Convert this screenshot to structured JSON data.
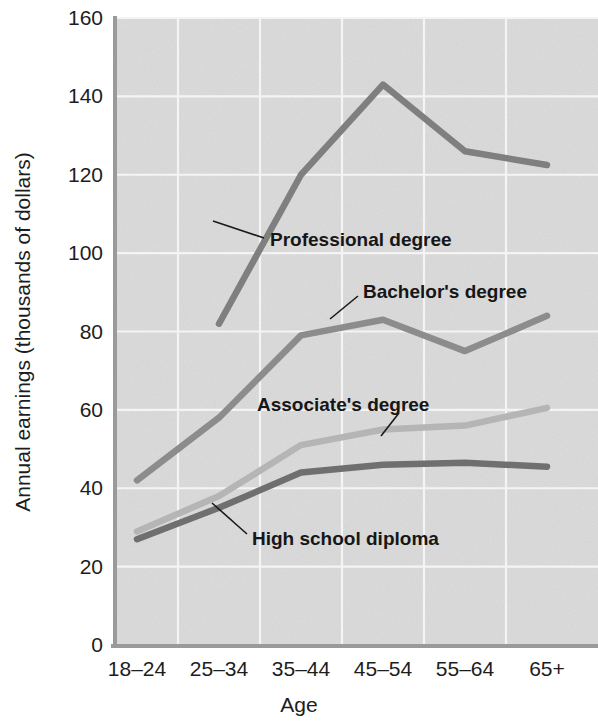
{
  "chart_data": {
    "type": "line",
    "title": "",
    "xlabel": "Age",
    "ylabel": "Annual earnings (thousands of dollars)",
    "categories": [
      "18–24",
      "25–34",
      "35–44",
      "45–54",
      "55–64",
      "65+"
    ],
    "ylim": [
      0,
      160
    ],
    "yticks": [
      0,
      20,
      40,
      60,
      80,
      100,
      120,
      140,
      160
    ],
    "ytick_labels": [
      "0",
      "20",
      "40",
      "60",
      "80",
      "100",
      "120",
      "140",
      "160"
    ],
    "grid": true,
    "legend_position": "inline-annotations",
    "series": [
      {
        "name": "Professional degree",
        "color": "#7f7f7f",
        "values": [
          null,
          82,
          120,
          143,
          126,
          122.5
        ]
      },
      {
        "name": "Bachelor's degree",
        "color": "#8c8c8c",
        "values": [
          42,
          58,
          79,
          83,
          75,
          84
        ]
      },
      {
        "name": "Associate's degree",
        "color": "#b5b5b5",
        "values": [
          29,
          38,
          51,
          55,
          56,
          60.5
        ]
      },
      {
        "name": "High school diploma",
        "color": "#6f6f6f",
        "values": [
          27,
          35,
          44,
          46,
          46.5,
          45.5
        ]
      }
    ],
    "annotations": [
      {
        "text": "Professional degree",
        "x": 270,
        "y": 240
      },
      {
        "text": "Bachelor's degree",
        "x": 345,
        "y": 303
      },
      {
        "text": "Associate's degree",
        "x": 300,
        "y": 406
      },
      {
        "text": "High school diploma",
        "x": 250,
        "y": 538
      }
    ]
  },
  "axes": {
    "x_title": "Age",
    "y_title": "Annual earnings (thousands of dollars)",
    "x_labels": [
      "18–24",
      "25–34",
      "35–44",
      "45–54",
      "55–64",
      "65+"
    ],
    "y_labels": [
      "0",
      "20",
      "40",
      "60",
      "80",
      "100",
      "120",
      "140",
      "160"
    ]
  },
  "labels": {
    "professional": "Professional degree",
    "bachelors": "Bachelor's degree",
    "associates": "Associate's degree",
    "highschool": "High school diploma"
  },
  "colors": {
    "plot_background": "#dcdcdc",
    "gridline": "#f4f4f4",
    "axis": "#9a9a9a",
    "professional": "#7f7f7f",
    "bachelors": "#8c8c8c",
    "associates": "#b5b5b5",
    "highschool": "#6f6f6f",
    "text": "#1d1d1d"
  }
}
